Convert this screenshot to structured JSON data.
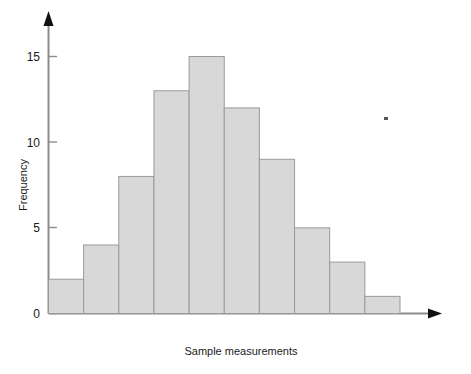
{
  "chart_data": {
    "type": "bar",
    "title": "",
    "subtitle": "",
    "xlabel": "Sample measurements",
    "ylabel": "Frequency",
    "categories": [
      "1",
      "2",
      "3",
      "4",
      "5",
      "6",
      "7",
      "8",
      "9",
      "10"
    ],
    "values": [
      2,
      4,
      8,
      13,
      15,
      12,
      9,
      5,
      3,
      1
    ],
    "series": [
      {
        "name": "Frequency",
        "values": [
          2,
          4,
          8,
          13,
          15,
          12,
          9,
          5,
          3,
          1
        ]
      }
    ],
    "ylim": [
      0,
      17
    ],
    "xlim": [
      0,
      10
    ],
    "ytick_labels": [
      "0",
      "5",
      "10",
      "15"
    ],
    "ytick_values": [
      0,
      5,
      10,
      15
    ],
    "xtick_labels": [],
    "grid": false,
    "legend": false,
    "legend_position": "none",
    "bar_fill_color": "#d8d8d8",
    "bar_border_color": "#9a9a9a",
    "axis_color": "#8c8c8c",
    "arrowhead_color": "#111111",
    "text_color": "#1a1a1a",
    "annotations": []
  },
  "axes": {
    "y_axis_title": "Frequency",
    "x_axis_title": "Sample measurements"
  },
  "marks": {
    "speck": ""
  }
}
